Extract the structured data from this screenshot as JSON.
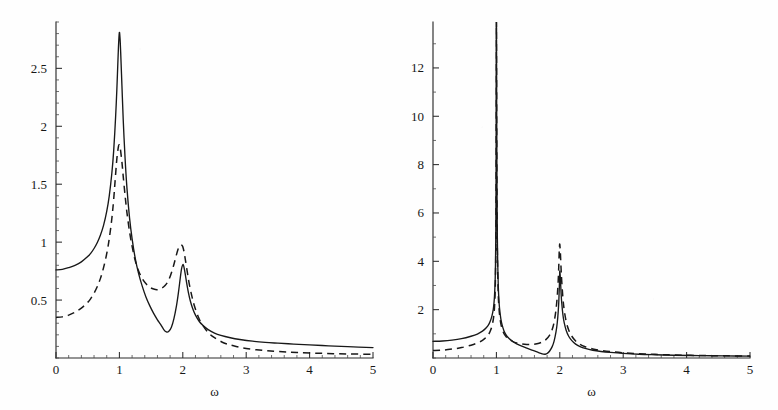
{
  "figure": {
    "name": "two-panel-spectral-response-figure",
    "background_color": "#fefefe",
    "ink_color": "#181818",
    "panel_count": 2
  },
  "chart_data": [
    {
      "id": "left",
      "type": "line",
      "title": "",
      "subtitle": "",
      "xlabel": "ω",
      "ylabel": "",
      "xlim": [
        0,
        5
      ],
      "ylim": [
        0,
        2.9
      ],
      "grid": false,
      "legend": null,
      "legend_position": "none",
      "xticks": [
        0,
        1,
        2,
        3,
        4,
        5
      ],
      "xticklabels": [
        "0",
        "1",
        "2",
        "3",
        "4",
        "5"
      ],
      "xminor_step": 0.2,
      "yticks": [
        0.5,
        1,
        1.5,
        2,
        2.5
      ],
      "yticklabels": [
        "0.5",
        "1",
        "1.5",
        "2",
        "2.5"
      ],
      "yminor_step": 0.1,
      "annotations": [],
      "series": [
        {
          "name": "solid",
          "style": "solid",
          "color": "#181818",
          "x": [
            0.0,
            0.1,
            0.2,
            0.3,
            0.4,
            0.5,
            0.55,
            0.6,
            0.65,
            0.7,
            0.75,
            0.8,
            0.84,
            0.88,
            0.91,
            0.94,
            0.96,
            0.98,
            0.99,
            1.0,
            1.01,
            1.02,
            1.04,
            1.06,
            1.09,
            1.12,
            1.16,
            1.2,
            1.25,
            1.3,
            1.36,
            1.42,
            1.48,
            1.54,
            1.6,
            1.65,
            1.7,
            1.74,
            1.78,
            1.82,
            1.86,
            1.9,
            1.93,
            1.96,
            1.98,
            2.0,
            2.01,
            2.02,
            2.04,
            2.06,
            2.09,
            2.12,
            2.16,
            2.2,
            2.26,
            2.32,
            2.4,
            2.5,
            2.6,
            2.75,
            2.9,
            3.1,
            3.3,
            3.5,
            3.75,
            4.0,
            4.3,
            4.6,
            5.0
          ],
          "y": [
            0.76,
            0.765,
            0.78,
            0.8,
            0.83,
            0.875,
            0.905,
            0.945,
            0.995,
            1.06,
            1.145,
            1.265,
            1.4,
            1.59,
            1.79,
            2.08,
            2.32,
            2.61,
            2.74,
            2.81,
            2.76,
            2.64,
            2.35,
            2.06,
            1.72,
            1.46,
            1.21,
            1.03,
            0.86,
            0.735,
            0.62,
            0.525,
            0.45,
            0.385,
            0.33,
            0.29,
            0.245,
            0.225,
            0.23,
            0.265,
            0.34,
            0.45,
            0.56,
            0.69,
            0.77,
            0.805,
            0.8,
            0.78,
            0.72,
            0.65,
            0.56,
            0.49,
            0.42,
            0.37,
            0.315,
            0.28,
            0.245,
            0.215,
            0.195,
            0.175,
            0.16,
            0.145,
            0.135,
            0.128,
            0.12,
            0.113,
            0.105,
            0.098,
            0.09
          ]
        },
        {
          "name": "dashed",
          "style": "dashed",
          "color": "#181818",
          "x": [
            0.0,
            0.1,
            0.2,
            0.3,
            0.4,
            0.5,
            0.55,
            0.6,
            0.65,
            0.7,
            0.75,
            0.8,
            0.84,
            0.88,
            0.91,
            0.94,
            0.96,
            0.98,
            0.99,
            1.0,
            1.01,
            1.02,
            1.04,
            1.06,
            1.09,
            1.12,
            1.16,
            1.2,
            1.25,
            1.3,
            1.36,
            1.42,
            1.48,
            1.54,
            1.6,
            1.66,
            1.72,
            1.78,
            1.84,
            1.88,
            1.92,
            1.95,
            1.97,
            1.99,
            2.0,
            2.02,
            2.04,
            2.07,
            2.1,
            2.14,
            2.18,
            2.24,
            2.3,
            2.4,
            2.5,
            2.65,
            2.8,
            3.0,
            3.25,
            3.5,
            3.8,
            4.2,
            4.6,
            5.0
          ],
          "y": [
            0.35,
            0.355,
            0.37,
            0.395,
            0.43,
            0.48,
            0.515,
            0.56,
            0.615,
            0.685,
            0.78,
            0.9,
            1.03,
            1.2,
            1.37,
            1.585,
            1.72,
            1.81,
            1.835,
            1.84,
            1.825,
            1.785,
            1.69,
            1.57,
            1.4,
            1.25,
            1.09,
            0.965,
            0.84,
            0.755,
            0.685,
            0.64,
            0.61,
            0.595,
            0.59,
            0.6,
            0.625,
            0.675,
            0.77,
            0.85,
            0.93,
            0.965,
            0.975,
            0.97,
            0.96,
            0.915,
            0.85,
            0.745,
            0.645,
            0.54,
            0.455,
            0.36,
            0.295,
            0.22,
            0.175,
            0.13,
            0.105,
            0.082,
            0.066,
            0.056,
            0.048,
            0.04,
            0.035,
            0.032
          ]
        }
      ]
    },
    {
      "id": "right",
      "type": "line",
      "title": "",
      "subtitle": "",
      "xlabel": "ω",
      "ylabel": "",
      "xlim": [
        0,
        5
      ],
      "ylim": [
        0,
        13.9
      ],
      "grid": false,
      "legend": null,
      "legend_position": "none",
      "xticks": [
        0,
        1,
        2,
        3,
        4,
        5
      ],
      "xticklabels": [
        "0",
        "1",
        "2",
        "3",
        "4",
        "5"
      ],
      "xminor_step": 0.2,
      "yticks": [
        2,
        4,
        6,
        8,
        10,
        12
      ],
      "yticklabels": [
        "2",
        "4",
        "6",
        "8",
        "10",
        "12"
      ],
      "yminor_step": 1,
      "annotations": [],
      "series": [
        {
          "name": "solid",
          "style": "solid",
          "color": "#181818",
          "x": [
            0.0,
            0.15,
            0.3,
            0.45,
            0.6,
            0.7,
            0.78,
            0.84,
            0.88,
            0.91,
            0.93,
            0.95,
            0.96,
            0.97,
            0.98,
            0.985,
            0.99,
            0.995,
            1.0,
            1.005,
            1.01,
            1.015,
            1.02,
            1.03,
            1.04,
            1.05,
            1.07,
            1.09,
            1.12,
            1.16,
            1.2,
            1.26,
            1.32,
            1.4,
            1.48,
            1.56,
            1.64,
            1.7,
            1.74,
            1.77,
            1.8,
            1.84,
            1.88,
            1.91,
            1.94,
            1.96,
            1.975,
            1.985,
            1.995,
            2.0,
            2.01,
            2.02,
            2.03,
            2.05,
            2.07,
            2.1,
            2.14,
            2.19,
            2.25,
            2.32,
            2.4,
            2.52,
            2.65,
            2.8,
            3.0,
            3.25,
            3.5,
            3.8,
            4.2,
            4.6,
            5.0
          ],
          "y": [
            0.69,
            0.705,
            0.74,
            0.8,
            0.9,
            0.99,
            1.11,
            1.25,
            1.39,
            1.57,
            1.74,
            2.0,
            2.22,
            2.56,
            3.18,
            3.8,
            4.95,
            7.6,
            13.9,
            9.8,
            6.6,
            5.0,
            4.05,
            2.95,
            2.4,
            2.05,
            1.62,
            1.37,
            1.12,
            0.93,
            0.81,
            0.68,
            0.585,
            0.49,
            0.41,
            0.33,
            0.25,
            0.19,
            0.16,
            0.155,
            0.185,
            0.29,
            0.47,
            0.7,
            1.08,
            1.46,
            1.92,
            2.38,
            3.15,
            3.6,
            3.25,
            2.7,
            2.3,
            1.77,
            1.45,
            1.15,
            0.9,
            0.72,
            0.575,
            0.47,
            0.395,
            0.32,
            0.27,
            0.23,
            0.19,
            0.155,
            0.135,
            0.115,
            0.098,
            0.085,
            0.075
          ]
        },
        {
          "name": "dashed",
          "style": "dashed",
          "color": "#181818",
          "x": [
            0.0,
            0.15,
            0.3,
            0.45,
            0.6,
            0.7,
            0.78,
            0.84,
            0.88,
            0.91,
            0.93,
            0.95,
            0.96,
            0.97,
            0.98,
            0.985,
            0.99,
            0.995,
            1.0,
            1.005,
            1.01,
            1.015,
            1.02,
            1.03,
            1.04,
            1.05,
            1.07,
            1.09,
            1.12,
            1.16,
            1.2,
            1.26,
            1.32,
            1.4,
            1.48,
            1.56,
            1.64,
            1.72,
            1.78,
            1.84,
            1.88,
            1.91,
            1.94,
            1.96,
            1.975,
            1.985,
            1.99,
            1.995,
            2.0,
            2.01,
            2.02,
            2.03,
            2.05,
            2.07,
            2.1,
            2.14,
            2.19,
            2.25,
            2.32,
            2.4,
            2.52,
            2.65,
            2.8,
            3.0,
            3.25,
            3.5,
            3.8,
            4.2,
            4.6,
            5.0
          ],
          "y": [
            0.31,
            0.325,
            0.37,
            0.43,
            0.53,
            0.62,
            0.73,
            0.86,
            0.99,
            1.16,
            1.33,
            1.58,
            1.79,
            2.1,
            2.7,
            3.3,
            4.4,
            7.0,
            13.9,
            9.2,
            6.0,
            4.5,
            3.6,
            2.6,
            2.1,
            1.79,
            1.42,
            1.21,
            1.01,
            0.86,
            0.77,
            0.68,
            0.625,
            0.58,
            0.56,
            0.56,
            0.59,
            0.66,
            0.76,
            0.95,
            1.18,
            1.48,
            2.0,
            2.56,
            3.2,
            3.9,
            4.35,
            4.6,
            4.7,
            4.3,
            3.7,
            3.2,
            2.45,
            1.98,
            1.52,
            1.16,
            0.9,
            0.7,
            0.56,
            0.465,
            0.375,
            0.315,
            0.265,
            0.215,
            0.175,
            0.15,
            0.125,
            0.105,
            0.092,
            0.082
          ]
        }
      ]
    }
  ]
}
